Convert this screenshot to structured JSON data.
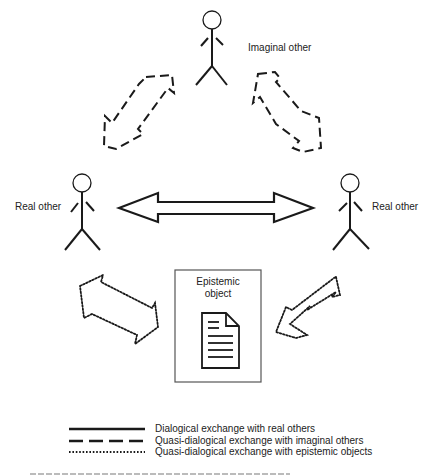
{
  "figure": {
    "nodes": {
      "imaginal_other": {
        "label": "Imaginal other"
      },
      "real_other_left": {
        "label": "Real other"
      },
      "real_other_right": {
        "label": "Real other"
      },
      "epistemic_object": {
        "label_line1": "Epistemic",
        "label_line2": "object",
        "icon": "document-icon"
      }
    },
    "arrows": [
      {
        "from": "real_other_left",
        "to": "real_other_right",
        "style": "solid",
        "type": "double-headed"
      },
      {
        "from": "real_other_left",
        "to": "imaginal_other",
        "style": "dashed",
        "type": "double-headed"
      },
      {
        "from": "real_other_right",
        "to": "imaginal_other",
        "style": "dashed",
        "type": "double-headed"
      },
      {
        "from": "real_other_left",
        "to": "epistemic_object",
        "style": "dotted",
        "type": "double-headed"
      },
      {
        "from": "real_other_right",
        "to": "epistemic_object",
        "style": "dotted",
        "type": "double-headed"
      }
    ],
    "colors": {
      "stroke": "#1a1a1a",
      "text": "#222222",
      "box_border": "#555555"
    }
  },
  "legend": {
    "items": [
      {
        "style": "solid",
        "label": "Dialogical exchange with real others"
      },
      {
        "style": "dashed",
        "label": "Quasi-dialogical exchange with imaginal others"
      },
      {
        "style": "dotted",
        "label": "Quasi-dialogical exchange with epistemic objects"
      }
    ]
  }
}
